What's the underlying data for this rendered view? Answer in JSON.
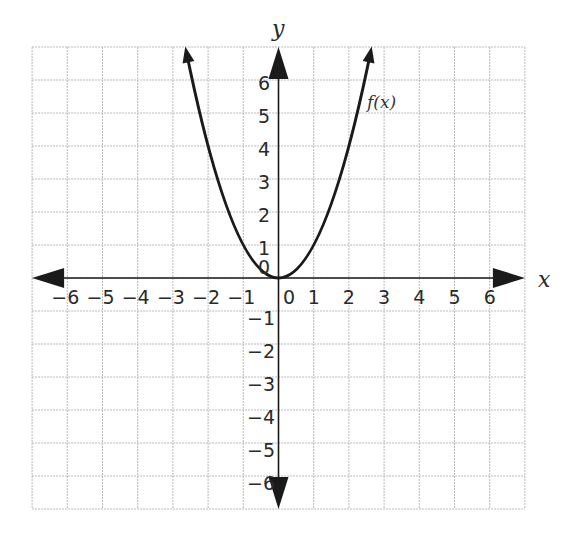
{
  "chart_data": {
    "type": "line",
    "title": "",
    "xlabel": "x",
    "ylabel": "y",
    "xlim": [
      -7,
      7
    ],
    "ylim": [
      -7,
      7
    ],
    "grid": true,
    "x_ticks": [
      -6,
      -5,
      -4,
      -3,
      -2,
      -1,
      0,
      1,
      2,
      3,
      4,
      5,
      6
    ],
    "y_ticks": [
      -6,
      -5,
      -4,
      -3,
      -2,
      -1,
      0,
      1,
      2,
      3,
      4,
      5,
      6
    ],
    "x_tick_labels": [
      "−6",
      "−5",
      "−4",
      "−3",
      "−2",
      "−1",
      "0",
      "1",
      "2",
      "3",
      "4",
      "5",
      "6"
    ],
    "y_tick_labels_positive": [
      "6",
      "5",
      "4",
      "3",
      "2",
      "1",
      "0"
    ],
    "y_tick_labels_negative": [
      "−1",
      "−2",
      "−3",
      "−4",
      "−5",
      "−6"
    ],
    "series": [
      {
        "name": "f(x)",
        "equation": "f(x) = x^2",
        "x": [
          -2.6,
          -2.4,
          -2,
          -1.5,
          -1,
          -0.5,
          0,
          0.5,
          1,
          1.5,
          2,
          2.4,
          2.6
        ],
        "y": [
          6.76,
          5.76,
          4,
          2.25,
          1,
          0.25,
          0,
          0.25,
          1,
          2.25,
          4,
          5.76,
          6.76
        ],
        "vertex": [
          0,
          0
        ],
        "arrows_at_ends": true,
        "color": "#1a1a1a"
      }
    ],
    "annotations": [
      {
        "text": "f(x)",
        "x": 2.5,
        "y": 5.3
      }
    ]
  },
  "labels": {
    "x_axis": "x",
    "y_axis": "y",
    "function": "f(x)"
  },
  "colors": {
    "grid": "#b9b9b9",
    "axis": "#1a1a1a",
    "curve": "#1a1a1a",
    "text": "#2a2a2a"
  }
}
